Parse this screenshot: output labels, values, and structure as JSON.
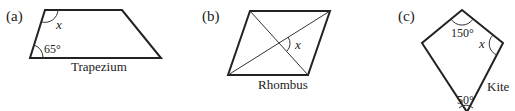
{
  "figures": [
    {
      "id": "a",
      "part_label": "(a)",
      "shape_name": "Trapezium",
      "angles": [
        {
          "label": "65°",
          "vertex": "bottom-left"
        },
        {
          "label": "x",
          "vertex": "top-left",
          "unknown": true
        }
      ]
    },
    {
      "id": "b",
      "part_label": "(b)",
      "shape_name": "Rhombus",
      "angles": [
        {
          "label": "x",
          "vertex": "diagonal-intersection",
          "unknown": true
        }
      ]
    },
    {
      "id": "c",
      "part_label": "(c)",
      "shape_name": "Kite",
      "angles": [
        {
          "label": "150°",
          "vertex": "top"
        },
        {
          "label": "x",
          "vertex": "right",
          "unknown": true
        },
        {
          "label": "50°",
          "vertex": "bottom"
        }
      ]
    }
  ]
}
